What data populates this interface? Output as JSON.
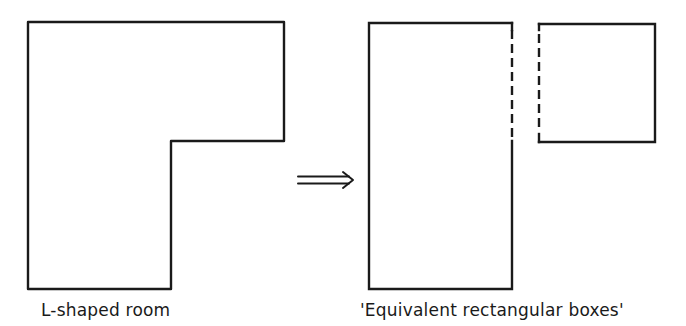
{
  "diagram": {
    "left_figure": {
      "label": "L-shaped room",
      "shape": "L-polygon",
      "points": [
        [
          28,
          22
        ],
        [
          284,
          22
        ],
        [
          284,
          141
        ],
        [
          171,
          141
        ],
        [
          171,
          289
        ],
        [
          28,
          289
        ]
      ]
    },
    "arrow": {
      "type": "double-line-implies-arrow",
      "from": [
        298,
        180
      ],
      "to": [
        354,
        180
      ]
    },
    "right_figure": {
      "label": "'Equivalent rectangular boxes'",
      "tall_box": {
        "x": 369,
        "y": 23,
        "width": 143,
        "height": 266,
        "dashed_side": "right-upper",
        "dashed_until_y": 141
      },
      "square_box": {
        "x": 539,
        "y": 24,
        "width": 116,
        "height": 118,
        "dashed_side": "left"
      }
    },
    "colors": {
      "stroke": "#1a1a1a",
      "background": "#ffffff"
    }
  }
}
